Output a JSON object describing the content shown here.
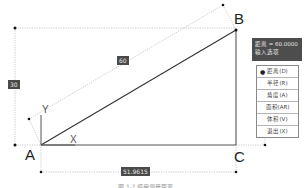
{
  "points": {
    "a": {
      "label": "A"
    },
    "b": {
      "label": "B"
    },
    "c": {
      "label": "C"
    }
  },
  "axes": {
    "x_label": "X",
    "y_label": "Y"
  },
  "dimensions": {
    "hypotenuse": "60",
    "height": "30",
    "base": "51.9615"
  },
  "tooltip": {
    "line1": "距离 = 60.0000",
    "line2": "输入选项"
  },
  "menu": {
    "items": [
      {
        "label": "距离(D)",
        "selected": true
      },
      {
        "label": "半径(R)",
        "selected": false
      },
      {
        "label": "角度(A)",
        "selected": false
      },
      {
        "label": "面积(AR)",
        "selected": false
      },
      {
        "label": "体积(V)",
        "selected": false
      },
      {
        "label": "退出(X)",
        "selected": false
      }
    ],
    "bullet": "●"
  },
  "caption": "图 1-? 使用测量距离",
  "colors": {
    "line": "#333333",
    "dotted": "#bdbdbd",
    "dim_box": "#4a4a4a",
    "tooltip_bg": "#4d4d4d"
  }
}
